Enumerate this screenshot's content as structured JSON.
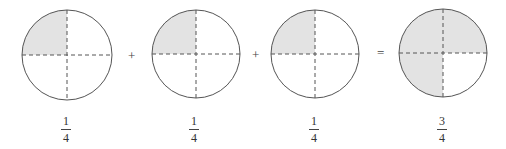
{
  "colors": {
    "shade": "#e3e3e3",
    "outline": "#555555",
    "dash": "#555555",
    "background": "#ffffff"
  },
  "circles": [
    {
      "cx": 67,
      "cy": 55,
      "r": 45,
      "shaded_quadrants": [
        "top-left"
      ]
    },
    {
      "cx": 196,
      "cy": 54,
      "r": 44,
      "shaded_quadrants": [
        "top-left"
      ]
    },
    {
      "cx": 315,
      "cy": 54,
      "r": 44,
      "shaded_quadrants": [
        "top-left"
      ]
    },
    {
      "cx": 443,
      "cy": 53,
      "r": 44,
      "shaded_quadrants": [
        "top-left",
        "top-right",
        "bottom-left"
      ]
    }
  ],
  "operators": [
    {
      "symbol": "+",
      "x": 132,
      "y": 56
    },
    {
      "symbol": "+",
      "x": 256,
      "y": 55
    },
    {
      "symbol": "=",
      "x": 381,
      "y": 53
    }
  ],
  "fractions": [
    {
      "numerator": "1",
      "denominator": "4"
    },
    {
      "numerator": "1",
      "denominator": "4"
    },
    {
      "numerator": "1",
      "denominator": "4"
    },
    {
      "numerator": "3",
      "denominator": "4"
    }
  ]
}
